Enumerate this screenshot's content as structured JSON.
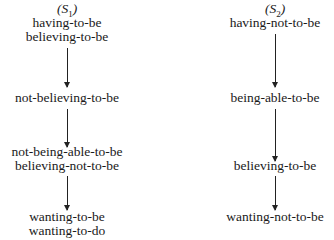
{
  "diagram": {
    "columns": [
      {
        "id": "S1",
        "title_prefix": "(",
        "title_letter": "S",
        "title_sub": "1",
        "title_suffix": ")",
        "nodes": [
          {
            "lines": [
              "having-to-be",
              "believing-to-be"
            ]
          },
          {
            "lines": [
              "not-believing-to-be"
            ]
          },
          {
            "lines": [
              "not-being-able-to-be",
              "believing-not-to-be"
            ]
          },
          {
            "lines": [
              "wanting-to-be",
              "wanting-to-do"
            ]
          }
        ]
      },
      {
        "id": "S2",
        "title_prefix": "(",
        "title_letter": "S",
        "title_sub": "2",
        "title_suffix": ")",
        "nodes": [
          {
            "lines": [
              "having-not-to-be"
            ]
          },
          {
            "lines": [
              "being-able-to-be"
            ]
          },
          {
            "lines": [
              "believing-to-be"
            ]
          },
          {
            "lines": [
              "wanting-not-to-be"
            ]
          }
        ]
      }
    ],
    "arrow_direction": "down"
  }
}
